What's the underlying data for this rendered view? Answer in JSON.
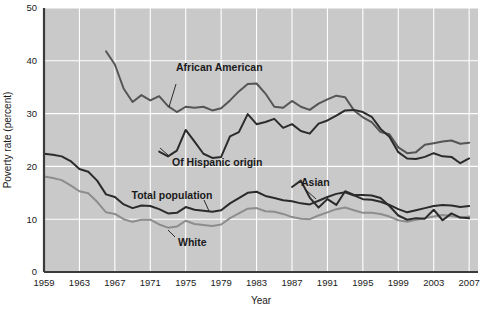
{
  "chart_data": {
    "type": "line",
    "title": "",
    "xlabel": "Year",
    "ylabel": "Poverty rate (percent)",
    "xlim": [
      1959,
      2008
    ],
    "ylim": [
      0,
      50
    ],
    "ytick_labels": [
      "0",
      "10",
      "20",
      "30",
      "40",
      "50"
    ],
    "ytick_values": [
      0,
      10,
      20,
      30,
      40,
      50
    ],
    "xtick_labels": [
      "1959",
      "1963",
      "1967",
      "1971",
      "1975",
      "1979",
      "1983",
      "1987",
      "1991",
      "1995",
      "1999",
      "2003",
      "2007"
    ],
    "xtick_values": [
      1959,
      1963,
      1967,
      1971,
      1975,
      1979,
      1983,
      1987,
      1991,
      1995,
      1999,
      2003,
      2007
    ],
    "grid": true,
    "grid_color": "#ffffff",
    "plot_background": "#c9c9c9",
    "legend_position": "inline-annotations",
    "series": [
      {
        "name": "African American",
        "label": "African American",
        "color": "#555555",
        "stroke_width": 2.0,
        "x": [
          1966,
          1967,
          1968,
          1969,
          1970,
          1971,
          1972,
          1973,
          1974,
          1975,
          1976,
          1977,
          1978,
          1979,
          1980,
          1981,
          1982,
          1983,
          1984,
          1985,
          1986,
          1987,
          1988,
          1989,
          1990,
          1991,
          1992,
          1993,
          1994,
          1995,
          1996,
          1997,
          1998,
          1999,
          2000,
          2001,
          2002,
          2003,
          2004,
          2005,
          2006,
          2007
        ],
        "values": [
          41.8,
          39.3,
          34.7,
          32.2,
          33.5,
          32.5,
          33.3,
          31.4,
          30.3,
          31.3,
          31.1,
          31.3,
          30.6,
          31.0,
          32.5,
          34.2,
          35.6,
          35.7,
          33.8,
          31.3,
          31.1,
          32.4,
          31.3,
          30.7,
          31.9,
          32.7,
          33.4,
          33.1,
          30.6,
          29.3,
          28.4,
          26.5,
          26.1,
          23.6,
          22.5,
          22.7,
          24.1,
          24.4,
          24.7,
          24.9,
          24.3,
          24.5
        ]
      },
      {
        "name": "Of Hispanic origin",
        "label": "Of Hispanic origin",
        "color": "#2b2b2b",
        "stroke_width": 2.0,
        "x": [
          1972,
          1973,
          1974,
          1975,
          1976,
          1977,
          1978,
          1979,
          1980,
          1981,
          1982,
          1983,
          1984,
          1985,
          1986,
          1987,
          1988,
          1989,
          1990,
          1991,
          1992,
          1993,
          1994,
          1995,
          1996,
          1997,
          1998,
          1999,
          2000,
          2001,
          2002,
          2003,
          2004,
          2005,
          2006,
          2007
        ],
        "values": [
          22.8,
          21.9,
          23.0,
          26.9,
          24.7,
          22.4,
          21.6,
          21.8,
          25.7,
          26.5,
          29.9,
          28.0,
          28.4,
          29.0,
          27.3,
          28.0,
          26.7,
          26.2,
          28.1,
          28.7,
          29.6,
          30.6,
          30.7,
          30.3,
          29.4,
          27.1,
          25.6,
          22.7,
          21.5,
          21.4,
          21.8,
          22.5,
          21.9,
          21.8,
          20.6,
          21.5
        ]
      },
      {
        "name": "Asian",
        "label": "Asian",
        "color": "#2b2b2b",
        "stroke_width": 2.0,
        "x": [
          1987,
          1988,
          1989,
          1990,
          1991,
          1992,
          1993,
          1994,
          1995,
          1996,
          1997,
          1998,
          1999,
          2000,
          2001,
          2002,
          2003,
          2004,
          2005,
          2006,
          2007
        ],
        "values": [
          16.1,
          17.3,
          14.1,
          12.2,
          13.8,
          12.7,
          15.3,
          14.6,
          14.6,
          14.5,
          14.0,
          12.5,
          10.7,
          9.9,
          10.2,
          10.1,
          11.8,
          9.8,
          11.1,
          10.3,
          10.2
        ]
      },
      {
        "name": "Total population",
        "label": "Total population",
        "color": "#2b2b2b",
        "stroke_width": 2.0,
        "x": [
          1959,
          1960,
          1961,
          1962,
          1963,
          1964,
          1965,
          1966,
          1967,
          1968,
          1969,
          1970,
          1971,
          1972,
          1973,
          1974,
          1975,
          1976,
          1977,
          1978,
          1979,
          1980,
          1981,
          1982,
          1983,
          1984,
          1985,
          1986,
          1987,
          1988,
          1989,
          1990,
          1991,
          1992,
          1993,
          1994,
          1995,
          1996,
          1997,
          1998,
          1999,
          2000,
          2001,
          2002,
          2003,
          2004,
          2005,
          2006,
          2007
        ],
        "values": [
          22.4,
          22.2,
          21.9,
          21.0,
          19.5,
          19.0,
          17.3,
          14.7,
          14.2,
          12.8,
          12.1,
          12.6,
          12.5,
          11.9,
          11.1,
          11.2,
          12.3,
          11.8,
          11.6,
          11.4,
          11.7,
          13.0,
          14.0,
          15.0,
          15.2,
          14.4,
          14.0,
          13.6,
          13.4,
          13.0,
          12.8,
          13.5,
          14.2,
          14.8,
          15.1,
          14.5,
          13.8,
          13.7,
          13.3,
          12.7,
          11.9,
          11.3,
          11.7,
          12.1,
          12.5,
          12.7,
          12.6,
          12.3,
          12.5
        ]
      },
      {
        "name": "White",
        "label": "White",
        "color": "#8d8d8d",
        "stroke_width": 2.0,
        "x": [
          1959,
          1960,
          1961,
          1962,
          1963,
          1964,
          1965,
          1966,
          1967,
          1968,
          1969,
          1970,
          1971,
          1972,
          1973,
          1974,
          1975,
          1976,
          1977,
          1978,
          1979,
          1980,
          1981,
          1982,
          1983,
          1984,
          1985,
          1986,
          1987,
          1988,
          1989,
          1990,
          1991,
          1992,
          1993,
          1994,
          1995,
          1996,
          1997,
          1998,
          1999,
          2000,
          2001,
          2002,
          2003,
          2004,
          2005,
          2006,
          2007
        ],
        "values": [
          18.1,
          17.8,
          17.4,
          16.4,
          15.3,
          14.9,
          13.3,
          11.3,
          11.0,
          10.0,
          9.5,
          9.9,
          9.9,
          9.0,
          8.4,
          8.6,
          9.7,
          9.1,
          8.9,
          8.7,
          9.0,
          10.2,
          11.1,
          12.0,
          12.1,
          11.5,
          11.4,
          11.0,
          10.4,
          10.1,
          10.0,
          10.7,
          11.3,
          11.9,
          12.2,
          11.7,
          11.2,
          11.2,
          11.0,
          10.5,
          9.8,
          9.5,
          9.9,
          10.2,
          10.5,
          10.8,
          10.6,
          10.3,
          10.5
        ]
      }
    ],
    "annotations": [
      {
        "text": "African American",
        "x": 1978,
        "y": 37.0
      },
      {
        "text": "Of Hispanic origin",
        "x": 1976,
        "y": 19.5
      },
      {
        "text": "Asian",
        "x": 1989,
        "y": 17.6
      },
      {
        "text": "Total population",
        "x": 1969,
        "y": 15.2
      },
      {
        "text": "White",
        "x": 1978,
        "y": 5.4
      }
    ]
  }
}
